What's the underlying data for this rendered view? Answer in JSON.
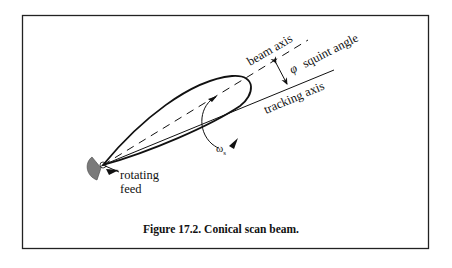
{
  "figure": {
    "caption": "Figure 17.2. Conical scan beam.",
    "labels": {
      "beam_axis": "beam axis",
      "squint_symbol": "φ",
      "squint_angle": "squint angle",
      "tracking_axis": "tracking axis",
      "rotating": "rotating",
      "feed": "feed",
      "omega": "ω",
      "omega_sub": "s"
    },
    "colors": {
      "frame": "#222222",
      "line": "#111111",
      "feed_fill": "#7a7a7a"
    }
  }
}
